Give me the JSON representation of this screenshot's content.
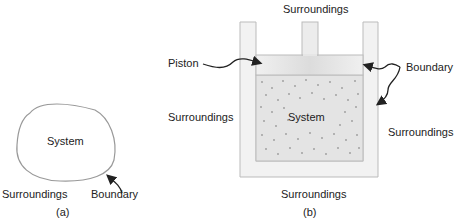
{
  "figure_a": {
    "system_label": "System",
    "surroundings_label": "Surroundings",
    "boundary_label": "Boundary",
    "caption": "(a)"
  },
  "figure_b": {
    "surroundings_top": "Surroundings",
    "surroundings_left": "Surroundings",
    "surroundings_right": "Surroundings",
    "surroundings_bottom": "Surroundings",
    "piston_label": "Piston",
    "boundary_label": "Boundary",
    "system_label": "System",
    "caption": "(b)"
  },
  "colors": {
    "wall": "#eeeeee",
    "gas": "#e2e2e2",
    "dots": "#9a9a9a",
    "outline": "#b5b5b5"
  }
}
